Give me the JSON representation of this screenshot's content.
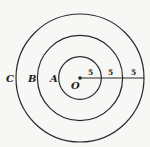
{
  "diagram": {
    "center": {
      "label": "O",
      "cx": 80,
      "cy": 78
    },
    "circles": [
      {
        "label": "A",
        "r": 21.3
      },
      {
        "label": "B",
        "r": 42.6
      },
      {
        "label": "C",
        "r": 64
      }
    ],
    "radius_segments": [
      "5",
      "5",
      "5"
    ],
    "colors": {
      "stroke": "#2a2a2a",
      "background": "#f7f7f5"
    }
  }
}
